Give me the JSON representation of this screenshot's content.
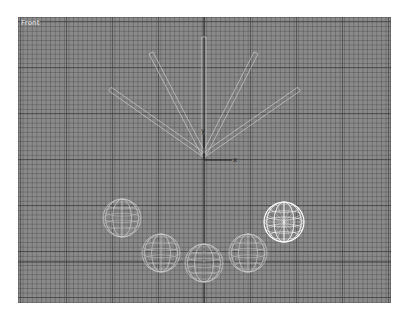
{
  "viewport": {
    "label": "Front",
    "background": "#8a8a8a",
    "wire_color": "#d6d6d6",
    "selected_color": "#ffffff",
    "axis_color": "#2e2e2e"
  },
  "gizmo": {
    "x_label": "x",
    "y_label": "y"
  },
  "objects": {
    "rods": [
      {
        "name": "rod-1",
        "x1": 92,
        "y1": 72,
        "x2": 186,
        "y2": 138
      },
      {
        "name": "rod-2",
        "x1": 133,
        "y1": 36,
        "x2": 186,
        "y2": 138
      },
      {
        "name": "rod-3",
        "x1": 186,
        "y1": 20,
        "x2": 186,
        "y2": 138
      },
      {
        "name": "rod-4",
        "x1": 238,
        "y1": 36,
        "x2": 186,
        "y2": 138
      },
      {
        "name": "rod-5",
        "x1": 281,
        "y1": 72,
        "x2": 186,
        "y2": 138
      }
    ],
    "spheres": [
      {
        "name": "sphere-1",
        "cx": 104,
        "cy": 201,
        "r": 19,
        "selected": false
      },
      {
        "name": "sphere-2",
        "cx": 143,
        "cy": 236,
        "r": 19,
        "selected": false
      },
      {
        "name": "sphere-3",
        "cx": 186,
        "cy": 246,
        "r": 19,
        "selected": false
      },
      {
        "name": "sphere-4",
        "cx": 230,
        "cy": 236,
        "r": 19,
        "selected": false
      },
      {
        "name": "sphere-5",
        "cx": 266,
        "cy": 205,
        "r": 20,
        "selected": true
      }
    ]
  }
}
